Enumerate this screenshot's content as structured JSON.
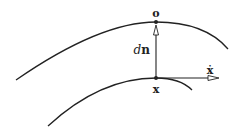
{
  "diagram": {
    "type": "geometric-sketch",
    "colors": {
      "stroke": "#222222",
      "background": "#ffffff"
    },
    "curves": [
      {
        "name": "upper-curve",
        "passes_through": "o"
      },
      {
        "name": "lower-curve",
        "passes_through": "x"
      }
    ],
    "points": [
      {
        "name": "o",
        "label": "o"
      },
      {
        "name": "x",
        "label": "x"
      }
    ],
    "vectors": [
      {
        "name": "normal-displacement",
        "label_italic": "d",
        "label_bold": "n",
        "from": "x",
        "to": "o",
        "arrowhead": "hollow"
      },
      {
        "name": "velocity",
        "label": "ẋ",
        "from": "x",
        "direction": "tangent",
        "arrowhead": "hollow"
      }
    ]
  }
}
